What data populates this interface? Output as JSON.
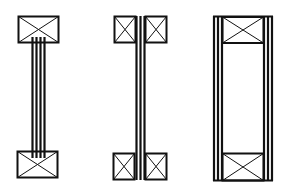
{
  "diagram": {
    "stroke_color": "#111111",
    "background_color": "#ffffff",
    "figures": [
      {
        "id": "i-joist-4-ply-web",
        "flange_count": 2,
        "flange_blocks_per_flange": 1,
        "web_plies": 4
      },
      {
        "id": "i-beam-split-flange",
        "flange_count": 2,
        "flange_blocks_per_flange": 2,
        "web_plies": 3
      },
      {
        "id": "box-beam",
        "flange_count": 2,
        "flange_blocks_per_flange": 1,
        "side_plies_each": 3
      }
    ]
  }
}
